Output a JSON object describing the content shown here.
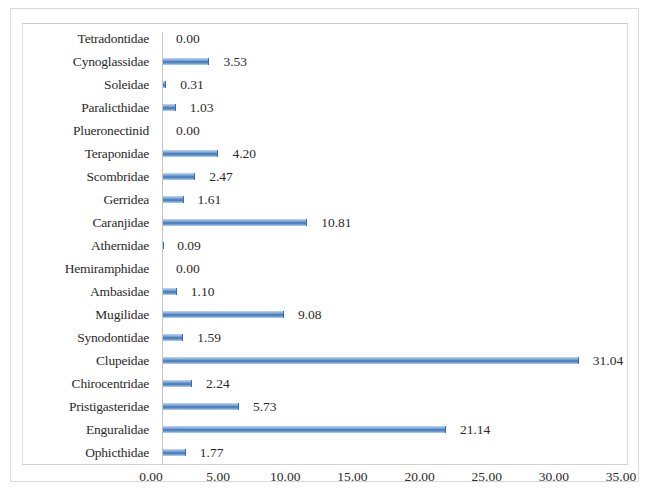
{
  "chart_data": {
    "type": "bar",
    "orientation": "horizontal",
    "title": "",
    "xlabel": "",
    "ylabel": "",
    "xlim": [
      0,
      35
    ],
    "xticks": [
      "0.00",
      "5.00",
      "10.00",
      "15.00",
      "20.00",
      "25.00",
      "30.00",
      "35.00"
    ],
    "xtick_values": [
      0,
      5,
      10,
      15,
      20,
      25,
      30,
      35
    ],
    "grid": false,
    "legend": "none",
    "value_label_format": "0.00",
    "bar_color": "#4a7ebb",
    "categories": [
      "Tetradontidae",
      "Cynoglassidae",
      "Soleidae",
      "Paralicthidae",
      "Plueronectinid",
      "Teraponidae",
      "Scombridae",
      "Gerridea",
      "Caranjidae",
      "Athernidae",
      "Hemiramphidae",
      "Ambasidae",
      "Mugilidae",
      "Synodontidae",
      "Clupeidae",
      "Chirocentridae",
      "Pristigasteridae",
      "Enguralidae",
      "Ophicthidae"
    ],
    "values": [
      0.0,
      3.53,
      0.31,
      1.03,
      0.0,
      4.2,
      2.47,
      1.61,
      10.81,
      0.09,
      0.0,
      1.1,
      9.08,
      1.59,
      31.04,
      2.24,
      5.73,
      21.14,
      1.77
    ],
    "value_labels": [
      "0.00",
      "3.53",
      "0.31",
      "1.03",
      "0.00",
      "4.20",
      "2.47",
      "1.61",
      "10.81",
      "0.09",
      "0.00",
      "1.10",
      "9.08",
      "1.59",
      "31.04",
      "2.24",
      "5.73",
      "21.14",
      "1.77"
    ]
  }
}
